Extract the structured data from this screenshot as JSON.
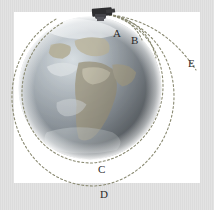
{
  "figure": {
    "background_color": "#d9d9d9",
    "panel_color": "#ffffff",
    "trajectory_color": "#8a8a72",
    "label_color": "#2b2b2b"
  },
  "cannon": {
    "name": "mountaintop cannon",
    "x": 103,
    "y": 12
  },
  "earth": {
    "name": "Earth globe",
    "center_x": 90,
    "center_y": 88,
    "radius": 73,
    "ocean_color": "#8d9aa3",
    "land_color": "#b9b39c",
    "highlight_color": "#e8eef2"
  },
  "labels": [
    {
      "id": "A",
      "text": "A",
      "x": 113,
      "y": 28
    },
    {
      "id": "B",
      "text": "B",
      "x": 131,
      "y": 35
    },
    {
      "id": "C",
      "text": "C",
      "x": 98,
      "y": 164
    },
    {
      "id": "D",
      "text": "D",
      "x": 100,
      "y": 189
    },
    {
      "id": "E",
      "text": "E",
      "x": 188,
      "y": 58
    }
  ],
  "trajectories": [
    {
      "id": "A",
      "description": "shortest ballistic arc, falls back to Earth near launch"
    },
    {
      "id": "B",
      "description": "longer ballistic arc, impacts further around the globe"
    },
    {
      "id": "C",
      "description": "near-circular low orbit around the Earth"
    },
    {
      "id": "D",
      "description": "larger elliptical orbit around the Earth"
    },
    {
      "id": "E",
      "description": "escape trajectory leaving the Earth"
    }
  ]
}
